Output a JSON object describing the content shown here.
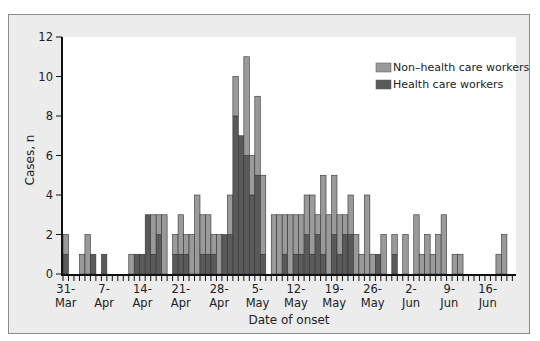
{
  "chart_data": {
    "type": "bar",
    "stacked": true,
    "title": "",
    "xlabel": "Date of onset",
    "ylabel": "Cases, n",
    "ylim": [
      0,
      12
    ],
    "yticks": [
      0,
      2,
      4,
      6,
      8,
      10,
      12
    ],
    "grid": false,
    "legend_position": "top-right",
    "x_tick_labels": [
      {
        "day": 0,
        "line1": "31-",
        "line2": "Mar"
      },
      {
        "day": 7,
        "line1": "7-",
        "line2": "Apr"
      },
      {
        "day": 14,
        "line1": "14-",
        "line2": "Apr"
      },
      {
        "day": 21,
        "line1": "21-",
        "line2": "Apr"
      },
      {
        "day": 28,
        "line1": "28-",
        "line2": "Apr"
      },
      {
        "day": 35,
        "line1": "5-",
        "line2": "May"
      },
      {
        "day": 42,
        "line1": "12-",
        "line2": "May"
      },
      {
        "day": 49,
        "line1": "19-",
        "line2": "May"
      },
      {
        "day": 56,
        "line1": "26-",
        "line2": "May"
      },
      {
        "day": 63,
        "line1": "2-",
        "line2": "Jun"
      },
      {
        "day": 70,
        "line1": "9-",
        "line2": "Jun"
      },
      {
        "day": 77,
        "line1": "16-",
        "line2": "Jun"
      }
    ],
    "num_days": 82,
    "series": [
      {
        "name": "Health care workers",
        "color": "#5a5a5a",
        "values": [
          1,
          0,
          0,
          0,
          0,
          1,
          0,
          1,
          0,
          0,
          0,
          0,
          0,
          1,
          1,
          3,
          1,
          2,
          0,
          0,
          1,
          1,
          1,
          0,
          0,
          1,
          1,
          1,
          0,
          2,
          2,
          8,
          7,
          6,
          4,
          5,
          1,
          0,
          0,
          0,
          1,
          0,
          1,
          1,
          2,
          1,
          2,
          1,
          0,
          2,
          1,
          2,
          2,
          0,
          0,
          0,
          0,
          1,
          0,
          0,
          1,
          0,
          0,
          0,
          0,
          0,
          0,
          0,
          0,
          0,
          0,
          0,
          0,
          0,
          0,
          0,
          0,
          0,
          0,
          0,
          0,
          0
        ]
      },
      {
        "name": "Non-health care workers",
        "color": "#9a9a9a",
        "values": [
          1,
          0,
          0,
          1,
          2,
          0,
          0,
          0,
          0,
          0,
          0,
          0,
          1,
          0,
          0,
          0,
          2,
          1,
          3,
          0,
          1,
          2,
          1,
          2,
          4,
          2,
          2,
          1,
          2,
          0,
          2,
          2,
          0,
          5,
          2,
          4,
          4,
          0,
          3,
          3,
          2,
          3,
          2,
          2,
          2,
          3,
          1,
          4,
          3,
          3,
          2,
          1,
          2,
          2,
          1,
          4,
          1,
          0,
          2,
          0,
          1,
          0,
          2,
          0,
          3,
          1,
          2,
          1,
          2,
          3,
          0,
          1,
          1,
          0,
          0,
          0,
          0,
          0,
          0,
          1,
          2,
          0
        ]
      }
    ],
    "totals": [
      2,
      0,
      0,
      1,
      2,
      1,
      0,
      1,
      0,
      0,
      0,
      0,
      1,
      1,
      1,
      3,
      3,
      3,
      3,
      0,
      2,
      3,
      2,
      2,
      4,
      3,
      3,
      2,
      2,
      2,
      4,
      10,
      7,
      11,
      6,
      9,
      5,
      0,
      3,
      3,
      3,
      3,
      3,
      3,
      4,
      4,
      3,
      5,
      3,
      5,
      3,
      3,
      4,
      2,
      1,
      4,
      1,
      1,
      2,
      0,
      2,
      0,
      2,
      0,
      3,
      1,
      2,
      1,
      2,
      3,
      0,
      1,
      1,
      0,
      0,
      0,
      0,
      0,
      0,
      1,
      2,
      0
    ]
  },
  "legend": {
    "items": [
      {
        "label": "Non–health care workers",
        "color": "#9a9a9a"
      },
      {
        "label": "Health care workers",
        "color": "#5a5a5a"
      }
    ]
  },
  "colors": {
    "frame_bg": "#ececec",
    "plot_bg": "#ffffff",
    "axis": "#111111",
    "hcw": "#5a5a5a",
    "non_hcw": "#9a9a9a",
    "bar_edge": "#333333"
  }
}
